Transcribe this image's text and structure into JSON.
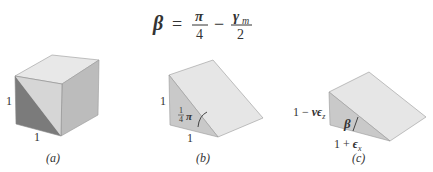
{
  "equation": {
    "lhs": "β",
    "eq": "=",
    "term1_num": "π",
    "term1_den": "4",
    "minus": "−",
    "term2_num": "γ",
    "term2_num_sub": "m",
    "term2_den": "2"
  },
  "figures": [
    {
      "id": "a",
      "shape": "cube",
      "caption": "(a)",
      "labels": {
        "left_edge": "1",
        "bottom_edge": "1"
      }
    },
    {
      "id": "b",
      "shape": "wedge",
      "caption": "(b)",
      "labels": {
        "left_edge": "1",
        "bottom_edge": "1",
        "angle_num": "1",
        "angle_den": "4",
        "angle_sym": "π"
      }
    },
    {
      "id": "c",
      "shape": "deformed-wedge",
      "caption": "(c)",
      "labels": {
        "left_edge_pre": "1 − ",
        "left_edge_nu": "ν",
        "left_edge_eps": "ϵ",
        "left_edge_sub": "z",
        "bottom_edge_pre": "1 + ",
        "bottom_edge_eps": "ϵ",
        "bottom_edge_sub": "x",
        "angle": "β"
      }
    }
  ],
  "colors": {
    "top_face": "#e6e6e6",
    "light_face": "#d9d9d9",
    "right_face": "#bdbdbd",
    "dark_face": "#7a7a7a",
    "wedge_side": "#c8c8c8",
    "edge": "#8a8a8a"
  }
}
